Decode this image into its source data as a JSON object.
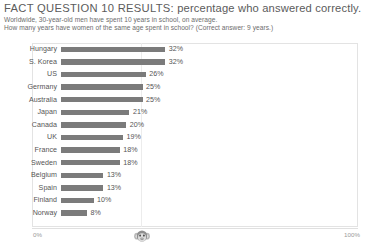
{
  "header": {
    "title_lead": "FACT QUESTION 10 RESULTS:",
    "title_rest": " percentage who answered correctly.",
    "subtitle_line_1": "Worldwide, 30-year-old men have spent 10 years in school, on average.",
    "subtitle_line_2": "How many years have women of the same age spent in school? (Correct answer: 9 years.)"
  },
  "axis": {
    "min_label": "0%",
    "max_label": "100%",
    "chimp_icon": "chimpanzee-icon"
  },
  "colors": {
    "bar": "#7b7b7b",
    "frame": "#e3e3e3",
    "text": "#555555",
    "axis_text": "#9a9a9a"
  },
  "chart_data": {
    "type": "bar",
    "orientation": "horizontal",
    "title": "FACT QUESTION 10 RESULTS: percentage who answered correctly.",
    "subtitle": "Worldwide, 30-year-old men have spent 10 years in school, on average. How many years have women of the same age spent in school? (Correct answer: 9 years.)",
    "xlabel": "",
    "ylabel": "",
    "xlim": [
      0,
      100
    ],
    "grid": false,
    "legend": null,
    "categories": [
      "Hungary",
      "S. Korea",
      "US",
      "Germany",
      "Australia",
      "Japan",
      "Canada",
      "UK",
      "France",
      "Sweden",
      "Belgium",
      "Spain",
      "Finland",
      "Norway"
    ],
    "values": [
      32,
      32,
      26,
      25,
      25,
      21,
      20,
      19,
      18,
      18,
      13,
      13,
      10,
      8
    ],
    "value_labels": [
      "32%",
      "32%",
      "26%",
      "25%",
      "25%",
      "21%",
      "20%",
      "19%",
      "18%",
      "18%",
      "13%",
      "13%",
      "10%",
      "8%"
    ],
    "annotations": [
      {
        "name": "chimpanzee-marker",
        "x": 33,
        "note": "chimp icon on axis at random-guess level"
      }
    ]
  },
  "rows": [
    {
      "label": "Hungary",
      "value": 32,
      "value_label": "32%"
    },
    {
      "label": "S. Korea",
      "value": 32,
      "value_label": "32%"
    },
    {
      "label": "US",
      "value": 26,
      "value_label": "26%"
    },
    {
      "label": "Germany",
      "value": 25,
      "value_label": "25%"
    },
    {
      "label": "Australia",
      "value": 25,
      "value_label": "25%"
    },
    {
      "label": "Japan",
      "value": 21,
      "value_label": "21%"
    },
    {
      "label": "Canada",
      "value": 20,
      "value_label": "20%"
    },
    {
      "label": "UK",
      "value": 19,
      "value_label": "19%"
    },
    {
      "label": "France",
      "value": 18,
      "value_label": "18%"
    },
    {
      "label": "Sweden",
      "value": 18,
      "value_label": "18%"
    },
    {
      "label": "Belgium",
      "value": 13,
      "value_label": "13%"
    },
    {
      "label": "Spain",
      "value": 13,
      "value_label": "13%"
    },
    {
      "label": "Finland",
      "value": 10,
      "value_label": "10%"
    },
    {
      "label": "Norway",
      "value": 8,
      "value_label": "8%"
    }
  ]
}
